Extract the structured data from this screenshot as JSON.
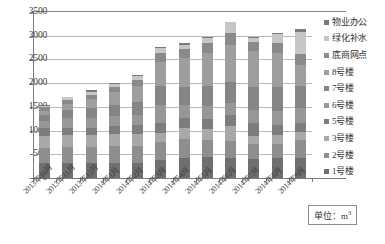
{
  "chart_data": {
    "type": "bar",
    "stacked": true,
    "title": "",
    "xlabel": "",
    "ylabel": "",
    "ylim": [
      0,
      3500
    ],
    "ytick_step": 500,
    "yticks": [
      0,
      500,
      1000,
      1500,
      2000,
      2500,
      3000,
      3500
    ],
    "grid": true,
    "legend_position": "right",
    "unit_note": "单位：m",
    "unit_exponent": "3",
    "categories": [
      "2013年10月",
      "2013年11月",
      "2013年12月",
      "2014年1月",
      "2014年2月",
      "2014年3月",
      "2014年4月",
      "2014年5月",
      "2014年6月",
      "2014年7月",
      "2014年8月",
      "2014年9月"
    ],
    "series": [
      {
        "name": "1号楼",
        "color": "#6f6f6f",
        "values": [
          320,
          325,
          325,
          310,
          320,
          380,
          430,
          440,
          430,
          400,
          420,
          420
        ]
      },
      {
        "name": "2号楼",
        "color": "#8e8e8e",
        "values": [
          310,
          330,
          330,
          355,
          350,
          375,
          390,
          370,
          345,
          310,
          300,
          380
        ]
      },
      {
        "name": "3号楼",
        "color": "#a8a8a8",
        "values": [
          260,
          255,
          255,
          265,
          265,
          190,
          240,
          220,
          330,
          180,
          180,
          170
        ]
      },
      {
        "name": "5号楼",
        "color": "#7d7d7d",
        "values": [
          160,
          155,
          150,
          170,
          175,
          205,
          215,
          225,
          230,
          275,
          220,
          200
        ]
      },
      {
        "name": "6号楼",
        "color": "#979797",
        "values": [
          150,
          200,
          215,
          200,
          215,
          400,
          260,
          260,
          250,
          280,
          300,
          300
        ]
      },
      {
        "name": "7号楼",
        "color": "#858585",
        "values": [
          120,
          165,
          210,
          240,
          270,
          400,
          390,
          420,
          440,
          470,
          510,
          480
        ]
      },
      {
        "name": "8号楼",
        "color": "#9e9e9e",
        "values": [
          90,
          130,
          180,
          280,
          350,
          500,
          600,
          700,
          780,
          760,
          700,
          430
        ]
      },
      {
        "name": "底商网点",
        "color": "#8a8a8a",
        "values": [
          80,
          90,
          95,
          110,
          125,
          180,
          190,
          210,
          250,
          200,
          210,
          240
        ]
      },
      {
        "name": "绿化补水",
        "color": "#c6c6c6",
        "values": [
          40,
          55,
          60,
          60,
          80,
          120,
          100,
          115,
          230,
          75,
          190,
          450
        ]
      },
      {
        "name": "物业办公",
        "color": "#7a7a7a",
        "values": [
          10,
          15,
          30,
          20,
          20,
          20,
          25,
          20,
          15,
          20,
          30,
          80
        ]
      }
    ],
    "totals": [
      1540,
      1720,
      1850,
      2010,
      2170,
      2770,
      2840,
      2980,
      3300,
      2970,
      3060,
      3150
    ]
  },
  "legend": {
    "items": [
      {
        "label": "物业办公",
        "color": "#7a7a7a"
      },
      {
        "label": "绿化补水",
        "color": "#c6c6c6"
      },
      {
        "label": "底商网点",
        "color": "#8a8a8a"
      },
      {
        "label": "8号楼",
        "color": "#9e9e9e"
      },
      {
        "label": "7号楼",
        "color": "#858585"
      },
      {
        "label": "6号楼",
        "color": "#979797"
      },
      {
        "label": "5号楼",
        "color": "#7d7d7d"
      },
      {
        "label": "3号楼",
        "color": "#a8a8a8"
      },
      {
        "label": "2号楼",
        "color": "#8e8e8e"
      },
      {
        "label": "1号楼",
        "color": "#6f6f6f"
      }
    ]
  },
  "unit_box": {
    "text": "单位：m",
    "sup": "3"
  }
}
